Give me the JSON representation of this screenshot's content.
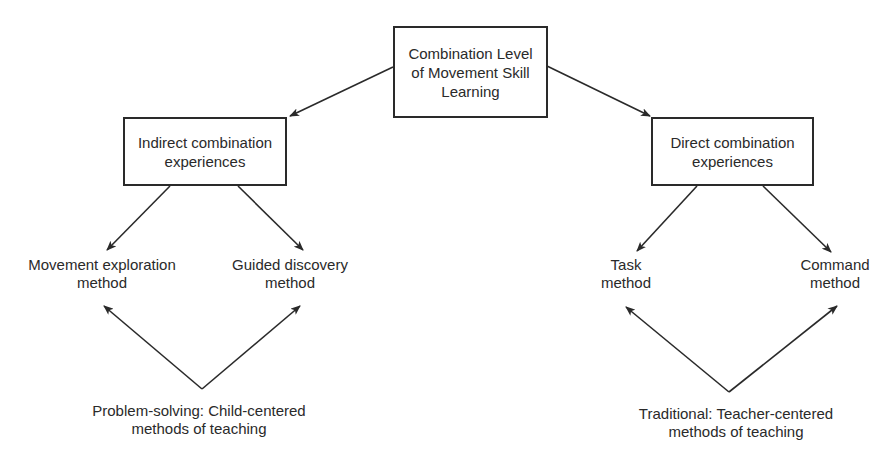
{
  "diagram": {
    "root": {
      "lines": [
        "Combination Level",
        "of Movement Skill",
        "Learning"
      ]
    },
    "branches": {
      "indirect": {
        "lines": [
          "Indirect combination",
          "experiences"
        ],
        "methods": [
          {
            "lines": [
              "Movement exploration",
              "method"
            ]
          },
          {
            "lines": [
              "Guided discovery",
              "method"
            ]
          }
        ],
        "category": {
          "lines": [
            "Problem-solving: Child-centered",
            "methods of teaching"
          ]
        }
      },
      "direct": {
        "lines": [
          "Direct combination",
          "experiences"
        ],
        "methods": [
          {
            "lines": [
              "Task",
              "method"
            ]
          },
          {
            "lines": [
              "Command",
              "method"
            ]
          }
        ],
        "category": {
          "lines": [
            "Traditional: Teacher-centered",
            "methods of teaching"
          ]
        }
      }
    },
    "colors": {
      "ink": "#2a2a2a",
      "background": "#ffffff"
    }
  }
}
